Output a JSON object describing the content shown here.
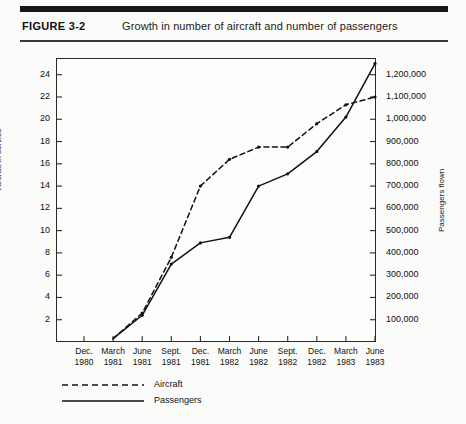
{
  "header": {
    "figure_number": "FIGURE 3-2",
    "caption": "Growth in number of aircraft and number of passengers"
  },
  "colors": {
    "ink": "#1a1a1a",
    "rule": "#16181a",
    "paper": "#fbfbf9",
    "plot_bg": "#fdfdfb"
  },
  "legend": {
    "items": [
      {
        "label": "Aircraft",
        "style": "dashed",
        "series": "aircraft"
      },
      {
        "label": "Passengers",
        "style": "solid",
        "series": "passengers"
      }
    ]
  },
  "chart_data": {
    "type": "line",
    "title": "Growth in number of aircraft and number of passengers",
    "xlabel": "",
    "grid": false,
    "legend_position": "below-left",
    "x": [
      "Dec. 1980",
      "March 1981",
      "June 1981",
      "Sept. 1981",
      "Dec. 1981",
      "March 1982",
      "June 1982",
      "Sept. 1982",
      "Dec. 1982",
      "March 1983",
      "June 1983"
    ],
    "x_tick_lines": [
      [
        "Dec.",
        "1980"
      ],
      [
        "March",
        "1981"
      ],
      [
        "June",
        "1981"
      ],
      [
        "Sept.",
        "1981"
      ],
      [
        "Dec.",
        "1981"
      ],
      [
        "March",
        "1982"
      ],
      [
        "June",
        "1982"
      ],
      [
        "Sept.",
        "1982"
      ],
      [
        "Dec.",
        "1982"
      ],
      [
        "March",
        "1983"
      ],
      [
        "June",
        "1983"
      ]
    ],
    "axes": {
      "left": {
        "label": "Aircraft in service",
        "ticks": [
          2,
          4,
          6,
          8,
          10,
          12,
          14,
          16,
          18,
          20,
          22,
          24
        ],
        "tick_labels": [
          "2",
          "4",
          "6",
          "8",
          "10",
          "12",
          "14",
          "16",
          "18",
          "20",
          "22",
          "24"
        ],
        "ylim": [
          0,
          25.5
        ]
      },
      "right": {
        "label": "Passengers flown",
        "ticks": [
          100000,
          200000,
          300000,
          400000,
          500000,
          600000,
          700000,
          800000,
          900000,
          1000000,
          1100000,
          1200000
        ],
        "tick_labels": [
          "100,000",
          "200,000",
          "300,000",
          "400,000",
          "500,000",
          "600,000",
          "700,000",
          "800,000",
          "900,000",
          "1,000,000",
          "1,100,000",
          "1,200,000"
        ],
        "ylim": [
          0,
          1275000
        ]
      }
    },
    "series": [
      {
        "name": "Aircraft",
        "axis": "left",
        "style": "dashed",
        "units": "aircraft in service",
        "values": [
          null,
          0.3,
          2.6,
          7.6,
          14.0,
          16.4,
          17.5,
          17.5,
          19.6,
          21.3,
          22.0
        ]
      },
      {
        "name": "Passengers",
        "axis": "right",
        "style": "solid",
        "units": "passengers flown",
        "values": [
          null,
          15000,
          120000,
          350000,
          445000,
          470000,
          700000,
          755000,
          855000,
          1010000,
          1250000
        ]
      }
    ]
  }
}
